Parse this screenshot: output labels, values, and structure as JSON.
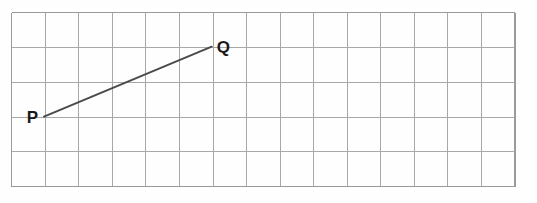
{
  "figure": {
    "background_color": "#fefefe",
    "grid_color": "#a8a8a8",
    "border_color": "#9a9a9a",
    "segment_color": "#4a4a4a",
    "label_color": "#1a1a1a"
  },
  "grid": {
    "columns": 15,
    "rows": 5,
    "cell_width": 33.55,
    "cell_height": 34.8,
    "origin_x": 11.7,
    "origin_y": 12.7,
    "right_x": 515.0,
    "bottom_y": 186.7
  },
  "labels": {
    "p": "P",
    "q": "Q"
  },
  "chart_data": {
    "type": "scatter",
    "xlabel": "",
    "ylabel": "",
    "grid": true,
    "legend": "none",
    "points": [
      {
        "name": "P",
        "grid_col": 1,
        "grid_row": 3,
        "pixel_x": 44.0,
        "pixel_y": 116.7
      },
      {
        "name": "Q",
        "grid_col": 6,
        "grid_row": 1,
        "pixel_x": 211.7,
        "pixel_y": 46.7
      }
    ],
    "segments": [
      {
        "from": "P",
        "to": "Q",
        "run_cells": 5,
        "rise_cells": 2
      }
    ],
    "xlim": [
      0,
      15
    ],
    "ylim": [
      0,
      5
    ]
  }
}
